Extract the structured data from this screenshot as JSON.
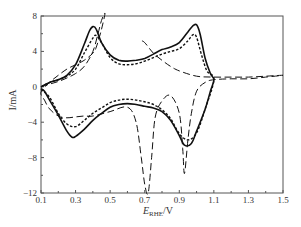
{
  "chart_data": {
    "type": "line",
    "title": "",
    "xlabel": "E_RHE/V",
    "xlabel_main": "E",
    "xlabel_sub": "RHE",
    "xlabel_unit": "/V",
    "ylabel": "I/mA",
    "xlim": [
      0.1,
      1.5
    ],
    "ylim": [
      -12,
      8
    ],
    "xticks": [
      "0.1",
      "0.3",
      "0.5",
      "0.7",
      "0.9",
      "1.1",
      "1.3",
      "1.5"
    ],
    "yticks": [
      "8",
      "4",
      "0",
      "-4",
      "-8",
      "-12"
    ],
    "grid": false,
    "legend": null,
    "series": [
      {
        "name": "solid",
        "style": "solid",
        "x": [
          0.1,
          0.15,
          0.2,
          0.25,
          0.3,
          0.35,
          0.38,
          0.4,
          0.42,
          0.45,
          0.5,
          0.55,
          0.6,
          0.65,
          0.7,
          0.75,
          0.8,
          0.85,
          0.9,
          0.95,
          0.98,
          1.0,
          1.02,
          1.05,
          1.08,
          1.1,
          1.08,
          1.05,
          1.0,
          0.97,
          0.93,
          0.9,
          0.85,
          0.8,
          0.75,
          0.7,
          0.65,
          0.6,
          0.55,
          0.5,
          0.45,
          0.4,
          0.35,
          0.3,
          0.28,
          0.25,
          0.2,
          0.15,
          0.12,
          0.1
        ],
        "y": [
          0.0,
          0.5,
          0.8,
          1.3,
          2.5,
          4.8,
          6.3,
          6.8,
          6.5,
          5.0,
          3.6,
          3.0,
          2.9,
          3.0,
          3.2,
          3.7,
          4.2,
          4.5,
          5.0,
          6.2,
          6.9,
          7.0,
          6.0,
          3.2,
          1.5,
          0.8,
          -0.5,
          -2.5,
          -5.0,
          -6.4,
          -6.6,
          -5.5,
          -3.8,
          -2.8,
          -2.4,
          -2.2,
          -2.0,
          -1.9,
          -2.0,
          -2.3,
          -3.0,
          -3.8,
          -4.8,
          -5.6,
          -5.7,
          -5.0,
          -3.2,
          -1.5,
          -0.5,
          -0.2
        ]
      },
      {
        "name": "short-dash",
        "style": "dotted",
        "x": [
          0.1,
          0.15,
          0.2,
          0.25,
          0.3,
          0.35,
          0.4,
          0.42,
          0.45,
          0.5,
          0.55,
          0.6,
          0.65,
          0.7,
          0.75,
          0.8,
          0.85,
          0.9,
          0.95,
          0.98,
          1.0,
          1.03,
          1.06,
          1.1,
          1.05,
          1.0,
          0.95,
          0.9,
          0.85,
          0.8,
          0.75,
          0.7,
          0.65,
          0.6,
          0.55,
          0.5,
          0.45,
          0.4,
          0.35,
          0.3,
          0.25,
          0.2,
          0.15,
          0.1
        ],
        "y": [
          0.0,
          0.5,
          0.8,
          1.2,
          2.0,
          3.8,
          5.5,
          5.8,
          5.0,
          3.3,
          2.6,
          2.5,
          2.6,
          2.9,
          3.3,
          3.7,
          4.0,
          4.3,
          5.2,
          5.9,
          5.6,
          3.5,
          1.8,
          0.8,
          -2.5,
          -5.2,
          -6.0,
          -5.3,
          -3.6,
          -2.6,
          -2.0,
          -1.7,
          -1.5,
          -1.4,
          -1.5,
          -1.8,
          -2.4,
          -3.0,
          -3.8,
          -4.5,
          -4.2,
          -3.0,
          -1.2,
          -0.3
        ]
      },
      {
        "name": "long-dash",
        "style": "dashed",
        "x": [
          0.1,
          0.15,
          0.2,
          0.25,
          0.3,
          0.35,
          0.4,
          0.43,
          0.45,
          0.47,
          0.45,
          0.42,
          0.4,
          0.35,
          0.3,
          0.25,
          0.2,
          0.15,
          0.1,
          0.12,
          0.15,
          0.2,
          0.25,
          0.3,
          0.35,
          0.4,
          0.5,
          0.6,
          0.65,
          0.68,
          0.7,
          0.72,
          0.74,
          0.76,
          0.8,
          0.85,
          0.9,
          0.92,
          0.93,
          0.95,
          0.97,
          1.0,
          1.05,
          1.1,
          1.2,
          1.3,
          1.4,
          1.5,
          1.4,
          1.3,
          1.2,
          1.1,
          1.0,
          0.9,
          0.85,
          0.8,
          0.75,
          0.7,
          0.68
        ],
        "y": [
          0.0,
          0.3,
          0.6,
          1.0,
          1.5,
          2.3,
          4.0,
          6.0,
          7.5,
          8.3,
          6.5,
          4.5,
          3.8,
          3.0,
          2.5,
          2.0,
          1.3,
          0.5,
          -0.6,
          -1.5,
          -2.5,
          -3.3,
          -3.5,
          -3.4,
          -3.3,
          -3.3,
          -2.8,
          -2.3,
          -4.0,
          -8.0,
          -11.0,
          -12.0,
          -8.0,
          -3.5,
          -1.6,
          -1.0,
          -3.0,
          -7.0,
          -9.8,
          -6.0,
          -3.0,
          -0.5,
          0.5,
          0.8,
          0.9,
          0.9,
          1.1,
          1.3,
          1.2,
          1.1,
          1.1,
          1.1,
          1.2,
          1.8,
          2.3,
          3.0,
          3.8,
          5.0,
          5.2
        ]
      }
    ]
  }
}
